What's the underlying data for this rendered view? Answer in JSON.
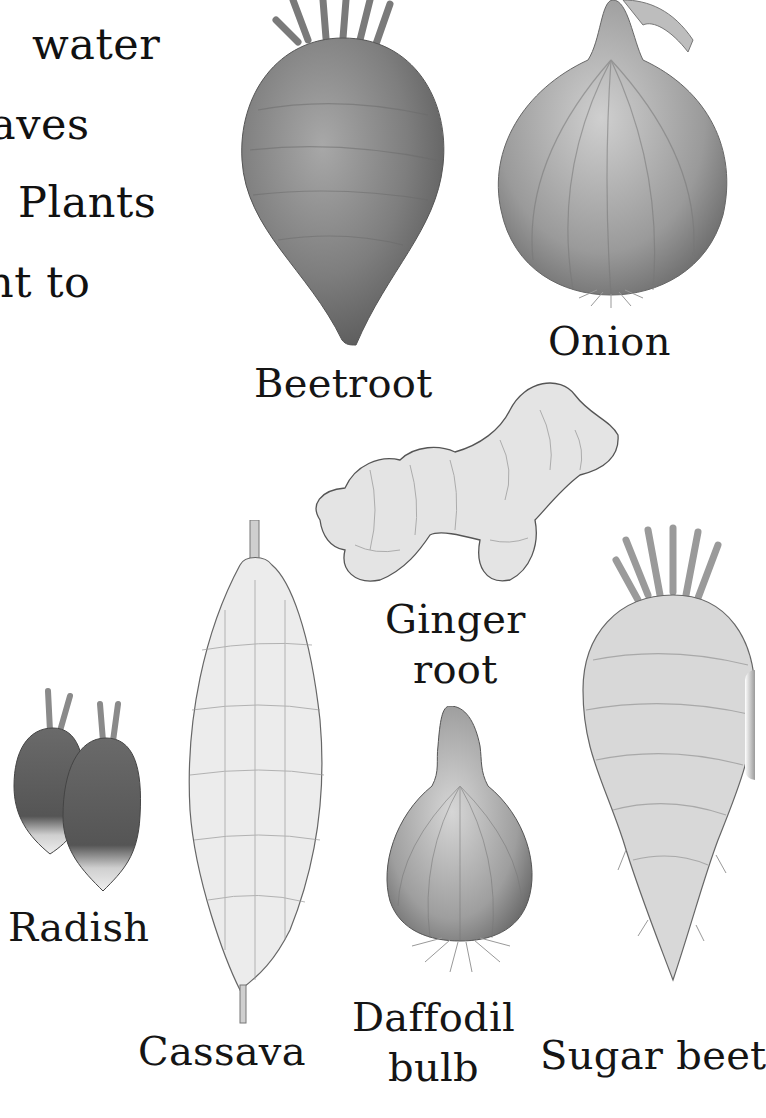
{
  "page": {
    "background": "#ffffff",
    "text_color": "#141414"
  },
  "body_text": {
    "lines": [
      "water",
      "aves",
      "Plants",
      "nt  to"
    ]
  },
  "specimens": [
    {
      "id": "beetroot",
      "label": "Beetroot",
      "tone": "#8a8a8a"
    },
    {
      "id": "onion",
      "label": "Onion",
      "tone": "#a6a6a6"
    },
    {
      "id": "ginger",
      "label_lines": [
        "Ginger",
        "root"
      ],
      "tone": "#d9d9d9"
    },
    {
      "id": "radish",
      "label": "Radish",
      "tone": "#6e6e6e"
    },
    {
      "id": "cassava",
      "label": "Cassava",
      "tone": "#e3e3e3"
    },
    {
      "id": "daffodil",
      "label_lines": [
        "Daffodil",
        "bulb"
      ],
      "tone": "#b4b4b4"
    },
    {
      "id": "sugar-beet",
      "label": "Sugar beet",
      "tone": "#cfcfcf"
    }
  ]
}
